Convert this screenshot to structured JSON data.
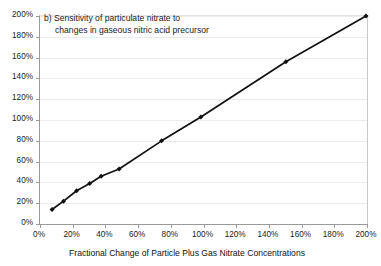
{
  "chart_data": {
    "type": "line",
    "title": "b) Sensitivity of particulate nitrate to changes in gaseous nitric acid precursor",
    "title_line1": "b) Sensitivity of particulate nitrate to",
    "title_line2": "changes in gaseous nitric acid precursor",
    "panel_label": "b)",
    "xlabel": "Fractional Change of Particle Plus Gas Nitrate Concentrations",
    "ylabel": "",
    "xlim": [
      0,
      200
    ],
    "ylim": [
      0,
      200
    ],
    "x_tick_labels": [
      "0%",
      "20%",
      "40%",
      "60%",
      "80%",
      "100%",
      "120%",
      "140%",
      "160%",
      "180%",
      "200%"
    ],
    "x_ticks": [
      0,
      20,
      40,
      60,
      80,
      100,
      120,
      140,
      160,
      180,
      200
    ],
    "y_tick_labels": [
      "0%",
      "20%",
      "40%",
      "60%",
      "80%",
      "100%",
      "120%",
      "140%",
      "160%",
      "180%",
      "200%"
    ],
    "y_ticks": [
      0,
      20,
      40,
      60,
      80,
      100,
      120,
      140,
      160,
      180,
      200
    ],
    "grid": "horizontal",
    "legend": "none",
    "marker": "filled-diamond",
    "series_color": "#111111",
    "grid_color": "#ececec",
    "axis_color": "#9a9a9a",
    "series": [
      {
        "name": "particulate nitrate response",
        "x": [
          8,
          15,
          23,
          31,
          38,
          49,
          75,
          99,
          151,
          200
        ],
        "y": [
          13,
          21,
          31,
          38,
          45,
          52,
          79,
          102,
          155,
          199
        ]
      }
    ]
  }
}
